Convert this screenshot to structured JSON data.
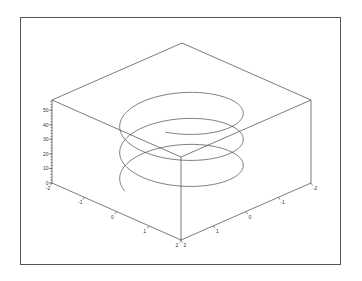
{
  "chart_data": {
    "type": "line3d",
    "title": "",
    "xlabel": "",
    "ylabel": "",
    "zlabel": "",
    "grid": false,
    "legend": null,
    "x_ticks": [
      "-2",
      "-1",
      "0",
      "1",
      "2"
    ],
    "y_ticks": [
      "2",
      "1",
      "0",
      "-1",
      "-2"
    ],
    "z_ticks": [
      "0",
      "10",
      "20",
      "30",
      "40",
      "50"
    ],
    "xlim": [
      -2,
      2
    ],
    "ylim": [
      -2,
      2
    ],
    "zlim": [
      0,
      57
    ],
    "series": [
      {
        "name": "helix",
        "param": "t",
        "x": "1.35*cos(t)",
        "y": "1.35*sin(t)",
        "z": "t*2.8 (approx, ~3 turns from 0 to ~53)",
        "turns": 3,
        "color": "#444444"
      }
    ]
  },
  "colors": {
    "frame_border": "#555555",
    "axis_line": "#444444",
    "curve": "#444444",
    "background": "#ffffff"
  }
}
